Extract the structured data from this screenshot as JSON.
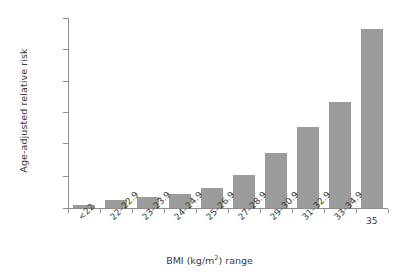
{
  "chart_data": {
    "type": "bar",
    "title": "",
    "xlabel": "BMI (kg/m2) range",
    "xlabel_prefix": "BMI (kg/m",
    "xlabel_superscript": "2",
    "xlabel_suffix": ") range",
    "ylabel": "Age-adjusted relative risk",
    "categories": [
      "<22",
      "22–22.9",
      "23–23.9",
      "24–24.9",
      "25–26.9",
      "27–28.9",
      "29–30.9",
      "31–32.9",
      "33–34.9",
      "35"
    ],
    "values": [
      1.0,
      2.6,
      3.4,
      4.4,
      6.1,
      10.2,
      17.0,
      30.2,
      46.0,
      93.2
    ],
    "ytick_labels": [
      "0",
      "10",
      "20",
      "40",
      "60",
      "80",
      "100"
    ],
    "ytick_values": [
      0,
      10,
      20,
      40,
      60,
      80,
      100
    ],
    "ylim": [
      0,
      100
    ],
    "grid": false,
    "legend": false,
    "axis_note": "non-linear y-axis: 0-20 expanded relative to 20-100",
    "bar_color": "#9b9b9b",
    "axis_color": "#8d8d8d",
    "text_color": "#3a3a3a"
  }
}
